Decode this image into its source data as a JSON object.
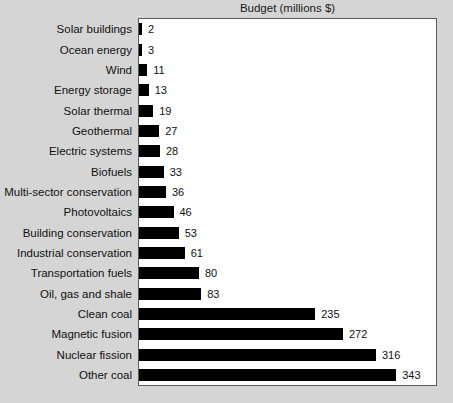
{
  "chart_data": {
    "type": "bar",
    "orientation": "horizontal",
    "title": "Budget (millions $)",
    "xlabel": "",
    "ylabel": "",
    "grid": false,
    "legend": null,
    "xlim": [
      0,
      396
    ],
    "value_labels_shown": true,
    "categories": [
      "Solar buildings",
      "Ocean energy",
      "Wind",
      "Energy storage",
      "Solar thermal",
      "Geothermal",
      "Electric systems",
      "Biofuels",
      "Multi-sector conservation",
      "Photovoltaics",
      "Building conservation",
      "Industrial conservation",
      "Transportation fuels",
      "Oil, gas and shale",
      "Clean coal",
      "Magnetic fusion",
      "Nuclear fission",
      "Other coal"
    ],
    "values": [
      2,
      3,
      11,
      13,
      19,
      27,
      28,
      33,
      36,
      46,
      53,
      61,
      80,
      83,
      235,
      272,
      316,
      343
    ],
    "value_labels": [
      "2",
      "3",
      "11",
      "13",
      "19",
      "27",
      "28",
      "33",
      "36",
      "46",
      "53",
      "61",
      "80",
      "83",
      "235",
      "272",
      "316",
      "343"
    ],
    "colors": {
      "bar": "#000000",
      "plot_background": "#ffffff",
      "figure_background": "#d5d5d5",
      "axis_border": "#5a5a5a",
      "text": "#111111"
    }
  }
}
